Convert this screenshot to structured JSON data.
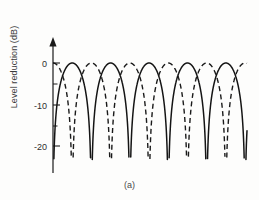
{
  "figure": {
    "caption": "(a)",
    "background": "#fdfdfc",
    "ink": "#1a1a1a"
  },
  "axis": {
    "y_label": "Level reduction (dB)",
    "tick_labels": [
      "0",
      "-10",
      "-20"
    ],
    "tick_values": [
      0,
      -10,
      -20
    ],
    "arrow": "y-axis-arrow"
  },
  "chart_data": {
    "type": "line",
    "title": "",
    "xlabel": "",
    "ylabel": "Level reduction (dB)",
    "xlim": [
      0,
      5.05
    ],
    "ylim": [
      -23,
      2
    ],
    "ytick_values": [
      0,
      -10,
      -20
    ],
    "ytick_labels": [
      "0",
      "-10",
      "-20"
    ],
    "yminor_ticks": [
      -5,
      -15
    ],
    "xaxis_visible": false,
    "grid": false,
    "legend": false,
    "annotations": [
      "(a)"
    ],
    "series": [
      {
        "name": "solid-response",
        "style": "solid",
        "color": "#141414",
        "peaks_x": [
          0.5,
          1.5,
          2.5,
          3.5,
          4.5
        ],
        "nulls_x": [
          0.0,
          1.0,
          2.0,
          3.0,
          4.0,
          5.0
        ],
        "peak_value_db": 0,
        "null_value_db": -23,
        "x": [
          0.02,
          0.06,
          0.1,
          0.15,
          0.2,
          0.25,
          0.3,
          0.35,
          0.4,
          0.45,
          0.5,
          0.55,
          0.6,
          0.65,
          0.7,
          0.75,
          0.8,
          0.85,
          0.9,
          0.94,
          0.98,
          1.0,
          1.02,
          1.06,
          1.1,
          1.15,
          1.2,
          1.25,
          1.3,
          1.35,
          1.4,
          1.45,
          1.5,
          1.55,
          1.6,
          1.65,
          1.7,
          1.75,
          1.8,
          1.85,
          1.9,
          1.94,
          1.98,
          2.0,
          2.02,
          2.06,
          2.1,
          2.15,
          2.2,
          2.25,
          2.3,
          2.35,
          2.4,
          2.45,
          2.5,
          2.55,
          2.6,
          2.65,
          2.7,
          2.75,
          2.8,
          2.85,
          2.9,
          2.94,
          2.98,
          3.0,
          3.02,
          3.06,
          3.1,
          3.15,
          3.2,
          3.25,
          3.3,
          3.35,
          3.4,
          3.45,
          3.5,
          3.55,
          3.6,
          3.65,
          3.7,
          3.75,
          3.8,
          3.85,
          3.9,
          3.94,
          3.98,
          4.0,
          4.02,
          4.06,
          4.1,
          4.15,
          4.2,
          4.25,
          4.3,
          4.35,
          4.4,
          4.45,
          4.5,
          4.55,
          4.6,
          4.65,
          4.7,
          4.75,
          4.8
        ],
        "y_db_note": "20*log10(|sin(pi*x)|) clipped at -23 dB"
      },
      {
        "name": "dashed-response",
        "style": "dashed",
        "color": "#1a1a1a",
        "peaks_x": [
          1.0,
          2.0,
          3.0,
          4.0,
          5.0
        ],
        "nulls_x": [
          0.0,
          0.5,
          1.5,
          2.5,
          3.5,
          4.5
        ],
        "peak_value_db": 0,
        "null_value_db": -23,
        "y_db_note": "20*log10(|cos(pi*x)|)-like lobes offset by half period, clipped at -23 dB"
      }
    ]
  }
}
